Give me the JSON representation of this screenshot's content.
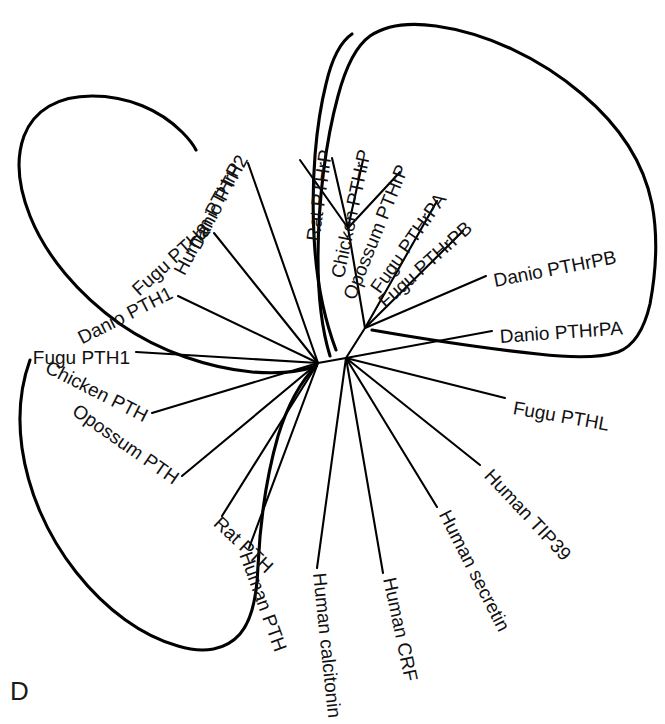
{
  "figure": {
    "panel_letter": "D",
    "type": "unrooted phylogenetic tree",
    "stroke_color": "#000000",
    "background_color": "#ffffff",
    "label_color": "#111111"
  },
  "chart_data": {
    "type": "tree",
    "title": "",
    "xlabel": "",
    "ylabel": "",
    "grid": false,
    "legend": "none",
    "layout": "unrooted radial (cladogram)",
    "clades": [
      {
        "name": "PTH clade",
        "outline": true,
        "members": [
          "Danio PTH2",
          "Fugu PTH2",
          "Danio PTH1",
          "Fugu PTH1",
          "Chicken PTH",
          "Opossum PTH",
          "Rat PTH",
          "Human PTH"
        ]
      },
      {
        "name": "PTHrP clade",
        "outline": true,
        "members": [
          "Human PTHrP",
          "Rat PTHrP",
          "Chicken PTHrP",
          "Opossum PTHrP",
          "Fugu PTHrPA",
          "Fugu PTHrPB",
          "Danio PTHrPB",
          "Danio PTHrPA"
        ]
      },
      {
        "name": "outgroups",
        "outline": false,
        "members": [
          "Fugu PTHL",
          "Human TIP39",
          "Human secretin",
          "Human CRF",
          "Human calcitonin"
        ]
      }
    ],
    "nodes": [
      {
        "id": "pth-node",
        "x": 318,
        "y": 363
      },
      {
        "id": "root-node",
        "x": 346,
        "y": 358
      },
      {
        "id": "pthrp-node",
        "x": 365,
        "y": 328
      },
      {
        "id": "pthrp-mammal",
        "x": 348,
        "y": 228
      }
    ],
    "tips": [
      {
        "label": "Human PTHrP",
        "parent": "pthrp-mammal",
        "tip_x": 300,
        "tip_y": 160,
        "label_x": 238,
        "label_y": 165,
        "rotate": -62,
        "anchor": "end"
      },
      {
        "label": "Rat PTHrP",
        "parent": "pthrp-mammal",
        "tip_x": 332,
        "tip_y": 158,
        "label_x": 327,
        "label_y": 150,
        "rotate": -82,
        "anchor": "end"
      },
      {
        "label": "Chicken PTHrP",
        "parent": "pthrp-mammal",
        "tip_x": 363,
        "tip_y": 160,
        "label_x": 366,
        "label_y": 150,
        "rotate": -78,
        "anchor": "end"
      },
      {
        "label": "Opossum PTHrP",
        "parent": "pthrp-mammal",
        "tip_x": 400,
        "tip_y": 172,
        "label_x": 404,
        "label_y": 166,
        "rotate": -68,
        "anchor": "end"
      },
      {
        "label": "Fugu PTHrPA",
        "parent": "pthrp-node",
        "tip_x": 437,
        "tip_y": 201,
        "label_x": 443,
        "label_y": 196,
        "rotate": -55,
        "anchor": "end"
      },
      {
        "label": "Fugu PTHrPB",
        "parent": "pthrp-node",
        "tip_x": 463,
        "tip_y": 231,
        "label_x": 470,
        "label_y": 226,
        "rotate": -42,
        "anchor": "end"
      },
      {
        "label": "Danio PTHrPB",
        "parent": "pthrp-node",
        "tip_x": 486,
        "tip_y": 276,
        "label_x": 494,
        "label_y": 282,
        "rotate": -11,
        "anchor": "start"
      },
      {
        "label": "Danio PTHrPA",
        "parent": "root-node",
        "tip_x": 492,
        "tip_y": 331,
        "label_x": 500,
        "label_y": 338,
        "rotate": -4,
        "anchor": "start"
      },
      {
        "label": "Fugu PTHL",
        "parent": "root-node",
        "tip_x": 505,
        "tip_y": 398,
        "label_x": 513,
        "label_y": 409,
        "rotate": 10,
        "anchor": "start"
      },
      {
        "label": "Human TIP39",
        "parent": "root-node",
        "tip_x": 480,
        "tip_y": 465,
        "label_x": 487,
        "label_y": 473,
        "rotate": 47,
        "anchor": "start"
      },
      {
        "label": "Human secretin",
        "parent": "root-node",
        "tip_x": 437,
        "tip_y": 507,
        "label_x": 443,
        "label_y": 512,
        "rotate": 63,
        "anchor": "start"
      },
      {
        "label": "Human CRF",
        "parent": "root-node",
        "tip_x": 383,
        "tip_y": 573,
        "label_x": 388,
        "label_y": 578,
        "rotate": 78,
        "anchor": "start"
      },
      {
        "label": "Human calcitonin",
        "parent": "root-node",
        "tip_x": 317,
        "tip_y": 568,
        "label_x": 318,
        "label_y": 573,
        "rotate": 84,
        "anchor": "start"
      },
      {
        "label": "Human PTH",
        "parent": "pth-node",
        "tip_x": 249,
        "tip_y": 548,
        "label_x": 244,
        "label_y": 553,
        "rotate": 70,
        "anchor": "start"
      },
      {
        "label": "Rat PTH",
        "parent": "pth-node",
        "tip_x": 222,
        "tip_y": 516,
        "label_x": 216,
        "label_y": 521,
        "rotate": 43,
        "anchor": "start"
      },
      {
        "label": "Opossum PTH",
        "parent": "pth-node",
        "tip_x": 182,
        "tip_y": 476,
        "label_x": 176,
        "label_y": 481,
        "rotate": 35,
        "anchor": "end"
      },
      {
        "label": "Chicken PTH",
        "parent": "pth-node",
        "tip_x": 152,
        "tip_y": 413,
        "label_x": 146,
        "label_y": 418,
        "rotate": 27,
        "anchor": "end"
      },
      {
        "label": "Fugu PTH1",
        "parent": "pth-node",
        "tip_x": 136,
        "tip_y": 352,
        "label_x": 130,
        "label_y": 359,
        "rotate": 0,
        "anchor": "end"
      },
      {
        "label": "Danio PTH1",
        "parent": "pth-node",
        "tip_x": 178,
        "tip_y": 296,
        "label_x": 172,
        "label_y": 293,
        "rotate": -27,
        "anchor": "end"
      },
      {
        "label": "Fugu PTH2",
        "parent": "pth-node",
        "tip_x": 214,
        "tip_y": 233,
        "label_x": 208,
        "label_y": 228,
        "rotate": -42,
        "anchor": "end"
      },
      {
        "label": "Danio PTH2",
        "parent": "pth-node",
        "tip_x": 248,
        "tip_y": 163,
        "label_x": 244,
        "label_y": 157,
        "rotate": -62,
        "anchor": "end"
      }
    ]
  },
  "labels": {
    "human_pthrp": "Human PTHrP",
    "rat_pthrp": "Rat PTHrP",
    "chicken_pthrp": "Chicken PTHrP",
    "opossum_pthrp": "Opossum PTHrP",
    "fugu_pthrpa": "Fugu PTHrPA",
    "fugu_pthrpb": "Fugu PTHrPB",
    "danio_pthrpb": "Danio PTHrPB",
    "danio_pthrpa": "Danio PTHrPA",
    "fugu_pthl": "Fugu PTHL",
    "human_tip39": "Human TIP39",
    "human_secretin": "Human secretin",
    "human_crf": "Human CRF",
    "human_calcitonin": "Human calcitonin",
    "human_pth": "Human PTH",
    "rat_pth": "Rat PTH",
    "opossum_pth": "Opossum PTH",
    "chicken_pth": "Chicken PTH",
    "fugu_pth1": "Fugu PTH1",
    "danio_pth1": "Danio PTH1",
    "fugu_pth2": "Fugu PTH2",
    "danio_pth2": "Danio PTH2"
  }
}
